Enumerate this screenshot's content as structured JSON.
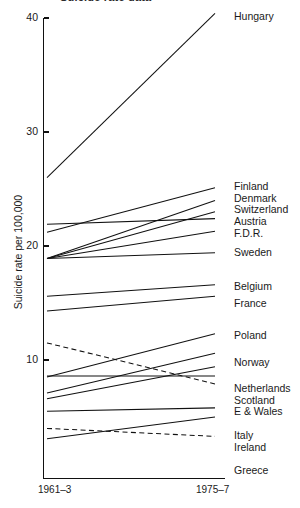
{
  "figure": {
    "title_clipped": "Suicide rate data",
    "ylabel": "Suicide rate per 100,000",
    "xlabel": ""
  },
  "axis": {
    "y_ticks": [
      "40",
      "30",
      "20",
      "10"
    ],
    "x_ticks": [
      "1961–3",
      "1975–7"
    ]
  },
  "chart_data": {
    "type": "line",
    "chart_subtype": "slopegraph",
    "title": "Suicide rate data",
    "xlabel": "",
    "ylabel": "Suicide rate per 100,000",
    "x": [
      "1961–3",
      "1975–7"
    ],
    "ylim": [
      2.5,
      40
    ],
    "yticks": [
      10,
      20,
      30,
      40
    ],
    "grid": false,
    "legend": "right-labels",
    "series": [
      {
        "name": "Hungary",
        "values": [
          26.0,
          40.4
        ],
        "style": "solid",
        "label": "Hungary"
      },
      {
        "name": "Finland",
        "values": [
          21.2,
          25.1
        ],
        "style": "solid",
        "label": "Finland"
      },
      {
        "name": "Denmark",
        "values": [
          18.9,
          24.0
        ],
        "style": "solid",
        "label": "Denmark"
      },
      {
        "name": "Switzerland",
        "values": [
          18.9,
          23.0
        ],
        "style": "solid",
        "label": "Switzerland"
      },
      {
        "name": "Austria",
        "values": [
          21.9,
          22.4
        ],
        "style": "solid",
        "label": "Austria"
      },
      {
        "name": "F.D.R.",
        "values": [
          18.9,
          21.3
        ],
        "style": "solid",
        "label": "F.D.R."
      },
      {
        "name": "Sweden",
        "values": [
          18.9,
          19.4
        ],
        "style": "solid",
        "label": "Sweden"
      },
      {
        "name": "Belgium",
        "values": [
          15.6,
          16.6
        ],
        "style": "solid",
        "label": "Belgium"
      },
      {
        "name": "France",
        "values": [
          14.3,
          15.6
        ],
        "style": "solid",
        "label": "France"
      },
      {
        "name": "Poland",
        "values": [
          8.5,
          12.3
        ],
        "style": "solid",
        "label": "Poland"
      },
      {
        "name": "Norway",
        "values": [
          7.1,
          10.6
        ],
        "style": "solid",
        "label": "Norway"
      },
      {
        "name": "Netherlands",
        "values": [
          6.6,
          9.4
        ],
        "style": "solid",
        "label": "Netherlands"
      },
      {
        "name": "Scotland",
        "values": [
          8.6,
          8.6
        ],
        "style": "solid",
        "label": "Scotland"
      },
      {
        "name": "E & Wales",
        "values": [
          11.5,
          7.9
        ],
        "style": "dashed",
        "label": "E & Wales"
      },
      {
        "name": "Italy",
        "values": [
          5.5,
          5.8
        ],
        "style": "solid",
        "label": "Italy"
      },
      {
        "name": "Ireland",
        "values": [
          3.1,
          5.0
        ],
        "style": "solid",
        "label": "Ireland"
      },
      {
        "name": "Greece",
        "values": [
          4.0,
          3.3
        ],
        "style": "dashed",
        "label": "Greece"
      }
    ]
  },
  "series_labels": [
    {
      "label": "Hungary",
      "top": 11
    },
    {
      "label": "Finland",
      "top": 181
    },
    {
      "label": "Denmark",
      "top": 193
    },
    {
      "label": "Switzerland",
      "top": 204
    },
    {
      "label": "Austria",
      "top": 216
    },
    {
      "label": "F.D.R.",
      "top": 228
    },
    {
      "label": "Sweden",
      "top": 247
    },
    {
      "label": "Belgium",
      "top": 281
    },
    {
      "label": "France",
      "top": 298
    },
    {
      "label": "Poland",
      "top": 330
    },
    {
      "label": "Norway",
      "top": 357
    },
    {
      "label": "Netherlands",
      "top": 383
    },
    {
      "label": "Scotland",
      "top": 395
    },
    {
      "label": "E & Wales",
      "top": 406
    },
    {
      "label": "Italy",
      "top": 430
    },
    {
      "label": "Ireland",
      "top": 442
    },
    {
      "label": "Greece",
      "top": 465
    }
  ]
}
